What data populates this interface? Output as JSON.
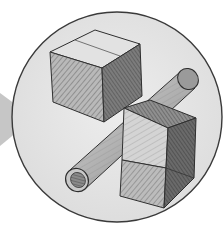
{
  "illustration": {
    "subject": "pencil sketch of geometric solids",
    "shapes": [
      "cube",
      "cylinder-tube",
      "bent-rectangular-prism"
    ],
    "frame": "circle",
    "pointer": "arrow-right"
  },
  "colors": {
    "background": "#ffffff",
    "disc_fill": "#e6e6e6",
    "disc_outline": "#3a3a3a",
    "arrow": "#c4c4c4",
    "light_face": "#dcdcdc",
    "mid_face": "#a8a8a8",
    "dark_face": "#6e6e6e",
    "line": "#2e2e2e"
  }
}
